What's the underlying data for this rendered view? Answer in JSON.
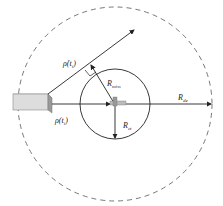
{
  "diagram": {
    "labels": {
      "rho_dot": "ρ̇(t",
      "rho_dot_sub": "i",
      "rho_dot_close": ")",
      "rho": "ρ(t",
      "rho_sub": "i",
      "rho_close": ")",
      "r_miss": "R",
      "r_miss_sub": "miss",
      "r_ct": "R",
      "r_ct_sub": "ct",
      "r_de": "R",
      "r_de_sub": "de"
    },
    "colors": {
      "stroke": "#222222",
      "dashed": "#555555",
      "block_top": "#eeeeee",
      "block_front": "#dddddd",
      "block_side": "#999999"
    }
  }
}
